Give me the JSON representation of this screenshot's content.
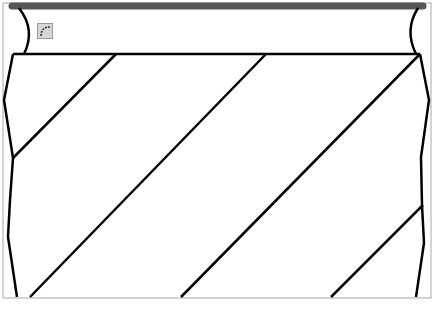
{
  "canvas": {
    "width": 433,
    "height": 310,
    "frame_color": "#a8a8a8",
    "top_bar_color": "#555555",
    "stroke_color": "#000000"
  },
  "toolbar": {
    "tools": [
      {
        "name": "fillet-arc-tool",
        "icon": "arc-corner-icon"
      }
    ]
  },
  "drawing": {
    "top_bar": {
      "x1": 12,
      "y1": 6,
      "x2": 423,
      "y2": 6
    },
    "top_edge": {
      "x1": 13,
      "y1": 54,
      "x2": 420,
      "y2": 54
    },
    "left_curve": "M 19 8 Q 36 30 24 54",
    "right_curve": "M 418 8 Q 404 30 416 54",
    "left_boundary": [
      [
        13,
        54
      ],
      [
        4,
        100
      ],
      [
        13,
        158
      ],
      [
        10,
        200
      ],
      [
        8,
        237
      ],
      [
        17,
        297
      ]
    ],
    "right_boundary": [
      [
        420,
        54
      ],
      [
        429,
        100
      ],
      [
        421,
        157
      ],
      [
        422,
        205
      ],
      [
        424,
        243
      ],
      [
        416,
        297
      ]
    ],
    "hatch_lines": [
      [
        [
          116,
          54
        ],
        [
          13,
          158
        ]
      ],
      [
        [
          266,
          54
        ],
        [
          30,
          297
        ]
      ],
      [
        [
          420,
          54
        ],
        [
          181,
          297
        ]
      ],
      [
        [
          423,
          205
        ],
        [
          331,
          297
        ]
      ]
    ]
  }
}
